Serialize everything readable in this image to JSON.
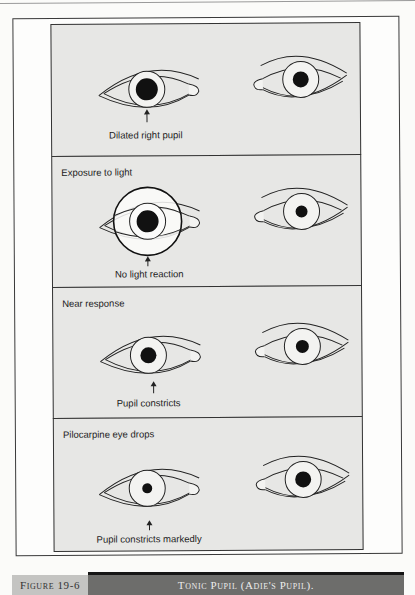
{
  "figure": {
    "label": "Figure 19-6",
    "title": "Tonic Pupil (Adie's Pupil)."
  },
  "panels": [
    {
      "title": "",
      "caption": "Dilated right pupil",
      "right_eye_pupil": "dilated",
      "left_eye_pupil": "normal",
      "light_circle": false
    },
    {
      "title": "Exposure to light",
      "caption": "No light reaction",
      "right_eye_pupil": "dilated",
      "left_eye_pupil": "small",
      "light_circle": true
    },
    {
      "title": "Near response",
      "caption": "Pupil constricts",
      "right_eye_pupil": "medium",
      "left_eye_pupil": "medium",
      "light_circle": false
    },
    {
      "title": "Pilocarpine eye drops",
      "caption": "Pupil constricts markedly",
      "right_eye_pupil": "small",
      "left_eye_pupil": "large",
      "light_circle": false
    }
  ],
  "colors": {
    "panel_bg": "#e7e7e5",
    "caption_label_bg": "#c4c4c2",
    "caption_title_bg": "#6d6d6b"
  }
}
